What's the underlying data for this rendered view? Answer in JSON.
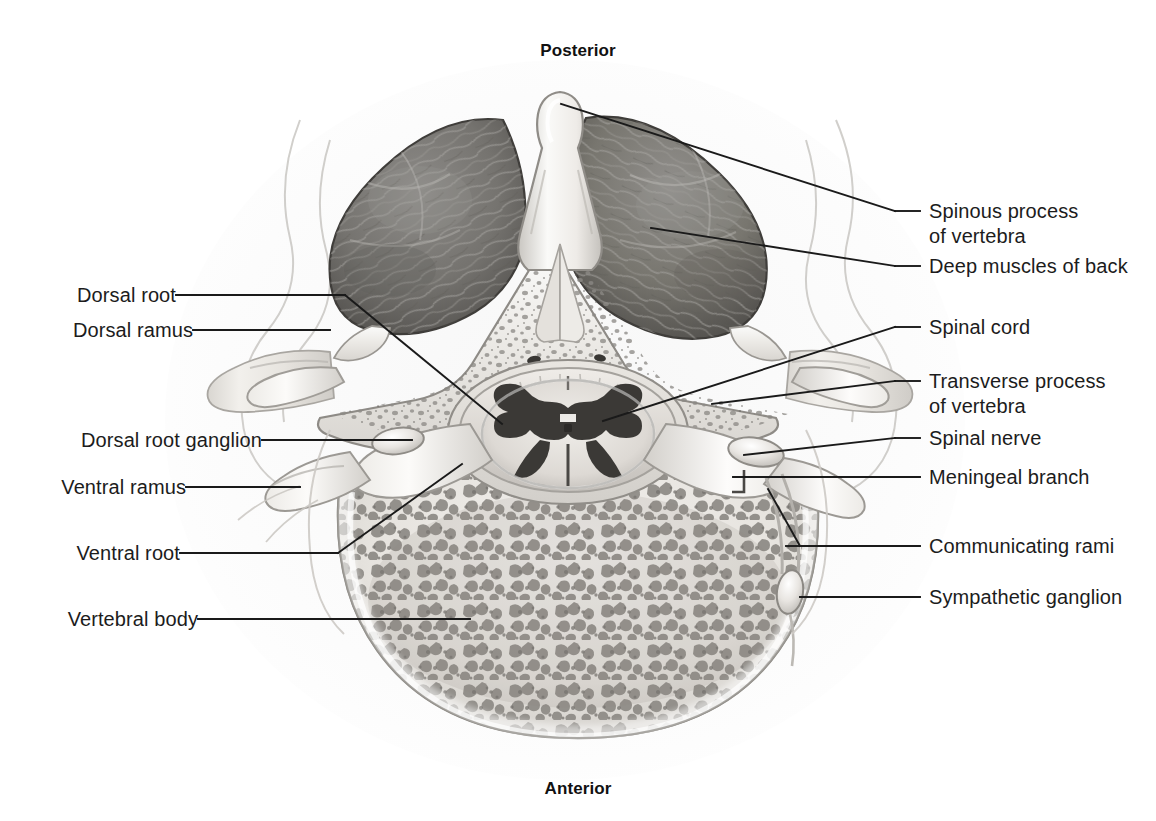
{
  "figure": {
    "type": "anatomical-illustration",
    "background_color": "#ffffff",
    "line_color": "#1a1a1a",
    "text_color": "#1c1c1c"
  },
  "orientation": {
    "top": "Posterior",
    "bottom": "Anterior"
  },
  "labels_right": [
    {
      "id": "spinous-process",
      "line1": "Spinous process",
      "line2": "of vertebra"
    },
    {
      "id": "deep-muscles-of-back",
      "line1": "Deep muscles of back",
      "line2": ""
    },
    {
      "id": "spinal-cord",
      "line1": "Spinal cord",
      "line2": ""
    },
    {
      "id": "transverse-process",
      "line1": "Transverse process",
      "line2": "of vertebra"
    },
    {
      "id": "spinal-nerve",
      "line1": "Spinal nerve",
      "line2": ""
    },
    {
      "id": "meningeal-branch",
      "line1": "Meningeal branch",
      "line2": ""
    },
    {
      "id": "communicating-rami",
      "line1": "Communicating rami",
      "line2": ""
    },
    {
      "id": "sympathetic-ganglion",
      "line1": "Sympathetic ganglion",
      "line2": ""
    }
  ],
  "labels_left": [
    {
      "id": "dorsal-root",
      "line1": "Dorsal root",
      "line2": ""
    },
    {
      "id": "dorsal-ramus",
      "line1": "Dorsal ramus",
      "line2": ""
    },
    {
      "id": "dorsal-root-ganglion",
      "line1": "Dorsal root ganglion",
      "line2": ""
    },
    {
      "id": "ventral-ramus",
      "line1": "Ventral ramus",
      "line2": ""
    },
    {
      "id": "ventral-root",
      "line1": "Ventral root",
      "line2": ""
    },
    {
      "id": "vertebral-body",
      "line1": "Vertebral body",
      "line2": ""
    }
  ],
  "structures": [
    {
      "id": "spinous-process",
      "description": "Bony midline projection at top"
    },
    {
      "id": "deep-muscles-of-back",
      "description": "Dark striated muscle masses flanking the spinous process"
    },
    {
      "id": "vertebral-arch",
      "description": "Pale bone with trabecular speckling forming spinal canal"
    },
    {
      "id": "spinal-cord",
      "description": "Oval cord with butterfly shaped grey matter in the vertebral canal"
    },
    {
      "id": "vertebral-body",
      "description": "Large rounded anterior bone filled with spongy trabecular bone"
    },
    {
      "id": "transverse-process",
      "description": "Lateral bony wings projecting left and right"
    },
    {
      "id": "dorsal-root-ganglion",
      "description": "Swelling on the dorsal root, left side"
    },
    {
      "id": "sympathetic-ganglion",
      "description": "Small oval ganglion anterolateral to vertebral body"
    }
  ]
}
